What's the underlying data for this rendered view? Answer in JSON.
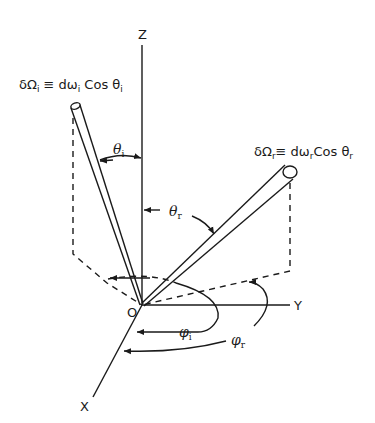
{
  "diagram": {
    "type": "3d-coordinate-geometry",
    "axes": {
      "z_label": "Z",
      "y_label": "Y",
      "x_label": "X",
      "origin_label": "O"
    },
    "incident": {
      "equation_prefix": "δΩ",
      "equation_sub": "i",
      "equation_mid": " ≡ dω",
      "equation_sub2": "i",
      "equation_suffix": " Cos θ",
      "equation_sub3": "i",
      "polar_angle_symbol": "θ",
      "polar_angle_sub": "i",
      "azimuth_symbol": "φ",
      "azimuth_sub": "i"
    },
    "reflected": {
      "equation_prefix": "δΩ",
      "equation_sub": "r",
      "equation_mid": "≡ dω",
      "equation_sub2": "r",
      "equation_suffix": "Cos θ",
      "equation_sub3": "r",
      "polar_angle_symbol": "θ",
      "polar_angle_sub": "r",
      "azimuth_symbol": "φ",
      "azimuth_sub": "r"
    },
    "colors": {
      "line": "#1a1a1a",
      "background": "#ffffff"
    }
  }
}
